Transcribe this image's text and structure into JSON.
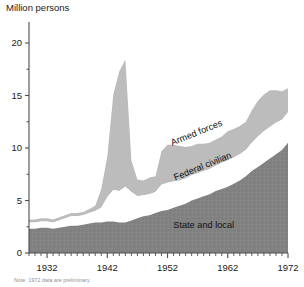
{
  "figure": {
    "axis_title": "Million persons",
    "note": "Note: 1972 data are preliminary."
  },
  "colors": {
    "armed_forces": "#bcbcbc",
    "federal_civilian": "#ffffff",
    "state_and_local": "#808080",
    "axis": "#4d4d4d",
    "text": "#1a1a1a"
  },
  "chart_data": {
    "type": "area",
    "stacked": true,
    "title": "",
    "subtitle": "",
    "xlabel": "",
    "ylabel": "Million persons",
    "xlim": [
      1929,
      1972
    ],
    "ylim": [
      0,
      22
    ],
    "grid": false,
    "legend_position": "inline-annotations",
    "x_ticks_major": [
      1932,
      1942,
      1952,
      1962,
      1972
    ],
    "x_ticks_minor_interval": 1,
    "y_ticks_major": [
      0,
      5,
      10,
      15,
      20
    ],
    "y_ticks_minor": [
      2.5,
      7.5,
      12.5,
      17.5
    ],
    "x": [
      1929,
      1930,
      1931,
      1932,
      1933,
      1934,
      1935,
      1936,
      1937,
      1938,
      1939,
      1940,
      1941,
      1942,
      1943,
      1944,
      1945,
      1946,
      1947,
      1948,
      1949,
      1950,
      1951,
      1952,
      1953,
      1954,
      1955,
      1956,
      1957,
      1958,
      1959,
      1960,
      1961,
      1962,
      1963,
      1964,
      1965,
      1966,
      1967,
      1968,
      1969,
      1970,
      1971,
      1972
    ],
    "series": [
      {
        "name": "State and local",
        "order": 1,
        "color": "#808080",
        "values": [
          2.3,
          2.3,
          2.4,
          2.4,
          2.3,
          2.4,
          2.5,
          2.6,
          2.6,
          2.7,
          2.8,
          2.9,
          2.9,
          3.0,
          3.0,
          2.9,
          2.9,
          3.1,
          3.3,
          3.5,
          3.6,
          3.8,
          4.0,
          4.1,
          4.3,
          4.5,
          4.7,
          5.0,
          5.2,
          5.4,
          5.6,
          5.9,
          6.1,
          6.3,
          6.6,
          6.9,
          7.3,
          7.8,
          8.2,
          8.6,
          9.0,
          9.4,
          9.8,
          10.5
        ]
      },
      {
        "name": "Federal civilian",
        "order": 2,
        "color": "#ffffff",
        "values": [
          0.6,
          0.6,
          0.6,
          0.6,
          0.6,
          0.7,
          0.8,
          0.9,
          0.9,
          0.9,
          1.0,
          1.1,
          1.4,
          2.3,
          3.0,
          3.0,
          3.4,
          2.7,
          2.1,
          2.0,
          2.0,
          2.0,
          2.5,
          2.6,
          2.5,
          2.4,
          2.4,
          2.4,
          2.4,
          2.4,
          2.4,
          2.4,
          2.5,
          2.5,
          2.5,
          2.5,
          2.5,
          2.7,
          2.9,
          3.0,
          3.0,
          3.0,
          2.9,
          2.9
        ]
      },
      {
        "name": "Armed forces",
        "order": 3,
        "color": "#bcbcbc",
        "values": [
          0.3,
          0.3,
          0.3,
          0.3,
          0.3,
          0.3,
          0.3,
          0.3,
          0.3,
          0.3,
          0.4,
          0.5,
          1.8,
          3.9,
          9.1,
          11.4,
          12.1,
          3.0,
          1.6,
          1.4,
          1.6,
          1.5,
          3.2,
          3.6,
          3.5,
          3.3,
          3.0,
          2.8,
          2.8,
          2.6,
          2.5,
          2.5,
          2.5,
          2.8,
          2.7,
          2.7,
          2.7,
          3.1,
          3.4,
          3.5,
          3.5,
          3.1,
          2.7,
          2.3
        ]
      }
    ],
    "annotations": [
      {
        "text": "Armed forces",
        "x": 1957,
        "y": 11.2,
        "rotation": -22
      },
      {
        "text": "Federal civilian",
        "x": 1958,
        "y": 8.0,
        "rotation": -22
      },
      {
        "text": "State and local",
        "x": 1958,
        "y": 2.4,
        "rotation": 0
      }
    ]
  }
}
